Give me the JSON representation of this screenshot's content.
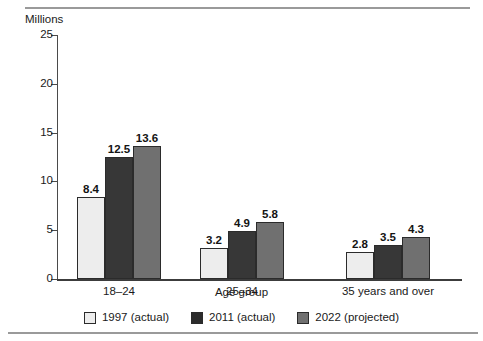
{
  "chart_data": {
    "type": "bar",
    "title": "",
    "ylabel": "Millions",
    "xlabel": "Age group",
    "categories": [
      "18–24",
      "25–34",
      "35 years and over"
    ],
    "series": [
      {
        "name": "1997 (actual)",
        "values": [
          8.4,
          3.2,
          2.8
        ],
        "color": "#ededed"
      },
      {
        "name": "2011 (actual)",
        "values": [
          12.5,
          4.9,
          3.5
        ],
        "color": "#373737"
      },
      {
        "name": "2022 (projected)",
        "values": [
          13.6,
          5.8,
          4.3
        ],
        "color": "#707070"
      }
    ],
    "ylim": [
      0,
      25
    ],
    "yticks": [
      0,
      5,
      10,
      15,
      20,
      25
    ],
    "ytick_labels": [
      "0",
      "5",
      "10",
      "15",
      "20",
      "25"
    ],
    "grid": false,
    "legend_position": "bottom",
    "data_labels": [
      [
        "8.4",
        "12.5",
        "13.6"
      ],
      [
        "3.2",
        "4.9",
        "5.8"
      ],
      [
        "2.8",
        "3.5",
        "4.3"
      ]
    ]
  },
  "colors": {
    "series_1997": "#ededed",
    "series_2011": "#373737",
    "series_2022": "#707070",
    "axis": "#3c3c3c",
    "rule": "#9a9a9a",
    "text": "#1a1a1a"
  }
}
